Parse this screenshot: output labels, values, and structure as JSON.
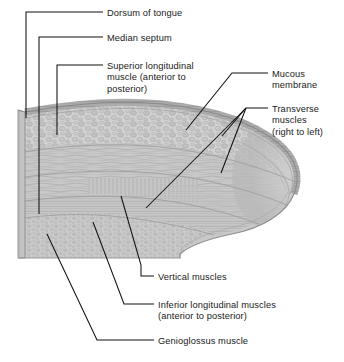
{
  "figure": {
    "type": "anatomical-illustration",
    "style": "grayscale halftone line drawing",
    "background_color": "#ffffff",
    "leader_line_color": "#111111",
    "palette": {
      "cut_face": "#c9c9c9",
      "mucous_membrane": "#9a9a9a",
      "superior_longitudinal": "#cfcfcf",
      "transverse_band": "#bdbdbd",
      "vertical_band": "#c4c4c4",
      "inferior_longitudinal": "#b8b8b8",
      "genioglossus": "#c6c6c6",
      "outline": "#6f6f6f"
    }
  },
  "labels": [
    {
      "id": "dorsum-of-tongue",
      "lines": [
        "Dorsum of tongue"
      ],
      "text_x": 107,
      "text_y": 8,
      "align": "left"
    },
    {
      "id": "median-septum",
      "lines": [
        "Median septum"
      ],
      "text_x": 107,
      "text_y": 33,
      "align": "left"
    },
    {
      "id": "superior-longitudinal-muscle",
      "lines": [
        "Superior longitudinal",
        "muscle (anterior to",
        "posterior)"
      ],
      "text_x": 107,
      "text_y": 61,
      "align": "left"
    },
    {
      "id": "mucous-membrane",
      "lines": [
        "Mucous",
        "membrane"
      ],
      "text_x": 272,
      "text_y": 69,
      "align": "left"
    },
    {
      "id": "transverse-muscles",
      "lines": [
        "Transverse",
        "muscles",
        "(right to left)"
      ],
      "text_x": 272,
      "text_y": 104,
      "align": "left"
    },
    {
      "id": "vertical-muscles",
      "lines": [
        "Vertical muscles"
      ],
      "text_x": 158,
      "text_y": 272,
      "align": "left"
    },
    {
      "id": "inferior-longitudinal-muscles",
      "lines": [
        "Inferior longitudinal muscles",
        "(anterior to posterior)"
      ],
      "text_x": 158,
      "text_y": 300,
      "align": "left"
    },
    {
      "id": "genioglossus-muscle",
      "lines": [
        "Genioglossus muscle"
      ],
      "text_x": 158,
      "text_y": 336,
      "align": "left"
    }
  ]
}
